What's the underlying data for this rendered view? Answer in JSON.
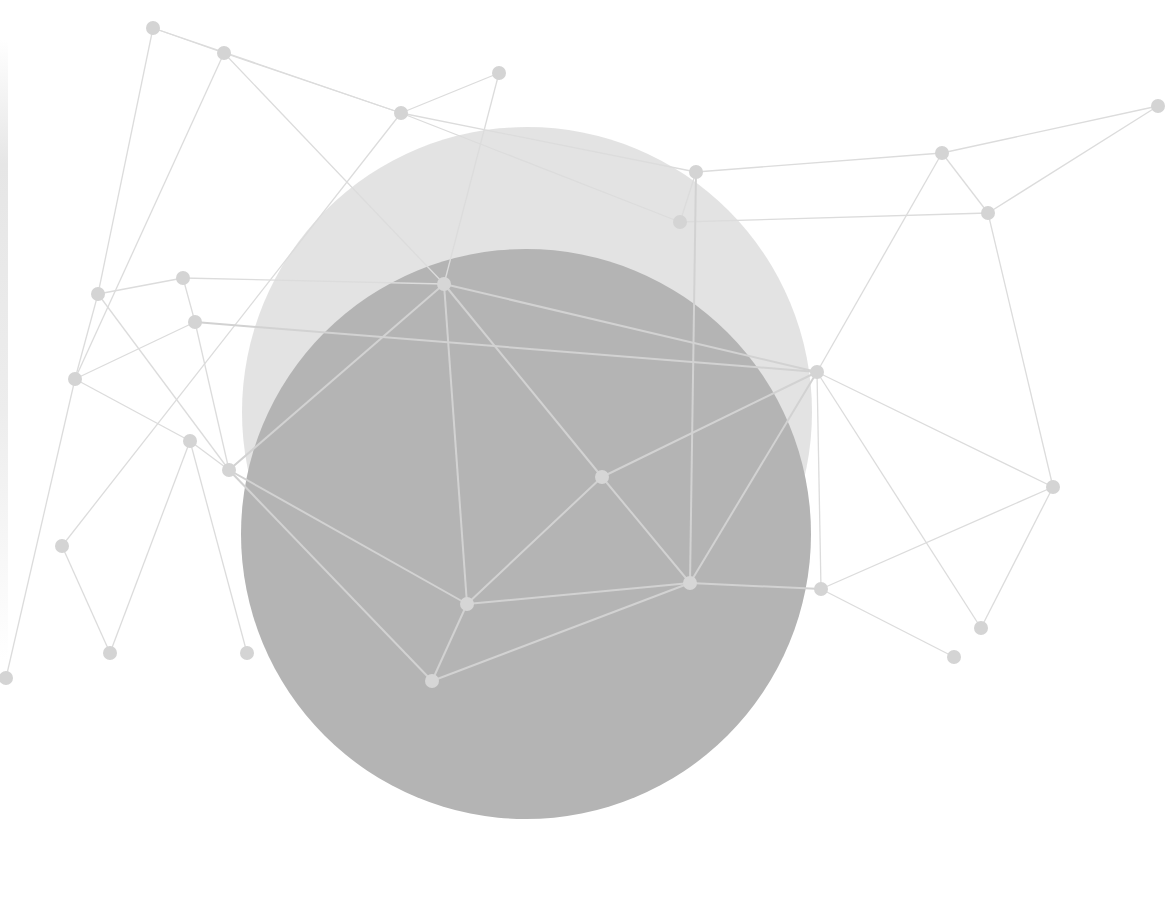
{
  "canvas": {
    "width": 1176,
    "height": 899,
    "background": "#ffffff"
  },
  "colors": {
    "circle_back": "#e0e0e0",
    "circle_front": "#b4b4b4",
    "line_outside": "#dcdcdc",
    "line_inside": "#d2d2d2",
    "node_outside": "#d4d4d4",
    "node_inside": "#d6d6d6"
  },
  "circles": [
    {
      "name": "back-circle",
      "cx": 527,
      "cy": 412,
      "r": 285,
      "color_key": "circle_back",
      "opacity": 0.9
    },
    {
      "name": "front-circle",
      "cx": 526,
      "cy": 534,
      "r": 285,
      "color_key": "circle_front",
      "opacity": 1
    }
  ],
  "nodes": [
    {
      "id": "n0",
      "x": 153,
      "y": 28
    },
    {
      "id": "n1",
      "x": 224,
      "y": 53
    },
    {
      "id": "n2",
      "x": 499,
      "y": 73
    },
    {
      "id": "n3",
      "x": 401,
      "y": 113
    },
    {
      "id": "n4",
      "x": 1158,
      "y": 106
    },
    {
      "id": "n5",
      "x": 942,
      "y": 153
    },
    {
      "id": "n6",
      "x": 696,
      "y": 172
    },
    {
      "id": "n7",
      "x": 988,
      "y": 213
    },
    {
      "id": "n8",
      "x": 680,
      "y": 222
    },
    {
      "id": "n9",
      "x": 183,
      "y": 278
    },
    {
      "id": "n10",
      "x": 444,
      "y": 284
    },
    {
      "id": "n11",
      "x": 98,
      "y": 294
    },
    {
      "id": "n12",
      "x": 195,
      "y": 322
    },
    {
      "id": "n13",
      "x": 817,
      "y": 372
    },
    {
      "id": "n14",
      "x": 75,
      "y": 379
    },
    {
      "id": "n15",
      "x": 190,
      "y": 441
    },
    {
      "id": "n16",
      "x": 229,
      "y": 470
    },
    {
      "id": "n17",
      "x": 602,
      "y": 477
    },
    {
      "id": "n18",
      "x": 1053,
      "y": 487
    },
    {
      "id": "n19",
      "x": 62,
      "y": 546
    },
    {
      "id": "n20",
      "x": 467,
      "y": 604
    },
    {
      "id": "n21",
      "x": 690,
      "y": 583
    },
    {
      "id": "n22",
      "x": 821,
      "y": 589
    },
    {
      "id": "n23",
      "x": 981,
      "y": 628
    },
    {
      "id": "n24",
      "x": 110,
      "y": 653
    },
    {
      "id": "n25",
      "x": 247,
      "y": 653
    },
    {
      "id": "n26",
      "x": 432,
      "y": 681
    },
    {
      "id": "n27",
      "x": 954,
      "y": 657
    },
    {
      "id": "n28",
      "x": 6,
      "y": 678
    }
  ],
  "edges": [
    [
      "n0",
      "n1"
    ],
    [
      "n0",
      "n3"
    ],
    [
      "n1",
      "n3"
    ],
    [
      "n1",
      "n10"
    ],
    [
      "n3",
      "n2"
    ],
    [
      "n3",
      "n8"
    ],
    [
      "n2",
      "n10"
    ],
    [
      "n1",
      "n14"
    ],
    [
      "n0",
      "n11"
    ],
    [
      "n3",
      "n19"
    ],
    [
      "n6",
      "n5"
    ],
    [
      "n5",
      "n4"
    ],
    [
      "n6",
      "n8"
    ],
    [
      "n8",
      "n7"
    ],
    [
      "n5",
      "n7"
    ],
    [
      "n7",
      "n4"
    ],
    [
      "n5",
      "n13"
    ],
    [
      "n7",
      "n18"
    ],
    [
      "n13",
      "n18"
    ],
    [
      "n13",
      "n22"
    ],
    [
      "n18",
      "n23"
    ],
    [
      "n13",
      "n23"
    ],
    [
      "n6",
      "n21"
    ],
    [
      "n10",
      "n13"
    ],
    [
      "n10",
      "n17"
    ],
    [
      "n10",
      "n9"
    ],
    [
      "n10",
      "n16"
    ],
    [
      "n10",
      "n20"
    ],
    [
      "n9",
      "n12"
    ],
    [
      "n9",
      "n11"
    ],
    [
      "n11",
      "n14"
    ],
    [
      "n11",
      "n16"
    ],
    [
      "n12",
      "n13"
    ],
    [
      "n14",
      "n15"
    ],
    [
      "n14",
      "n12"
    ],
    [
      "n15",
      "n16"
    ],
    [
      "n15",
      "n24"
    ],
    [
      "n16",
      "n20"
    ],
    [
      "n16",
      "n26"
    ],
    [
      "n17",
      "n13"
    ],
    [
      "n17",
      "n20"
    ],
    [
      "n17",
      "n21"
    ],
    [
      "n20",
      "n21"
    ],
    [
      "n20",
      "n26"
    ],
    [
      "n21",
      "n13"
    ],
    [
      "n21",
      "n22"
    ],
    [
      "n26",
      "n21"
    ],
    [
      "n22",
      "n27"
    ],
    [
      "n22",
      "n18"
    ],
    [
      "n15",
      "n25"
    ],
    [
      "n19",
      "n24"
    ],
    [
      "n14",
      "n28"
    ],
    [
      "n12",
      "n16"
    ],
    [
      "n6",
      "n3"
    ]
  ],
  "node_radius": 7
}
